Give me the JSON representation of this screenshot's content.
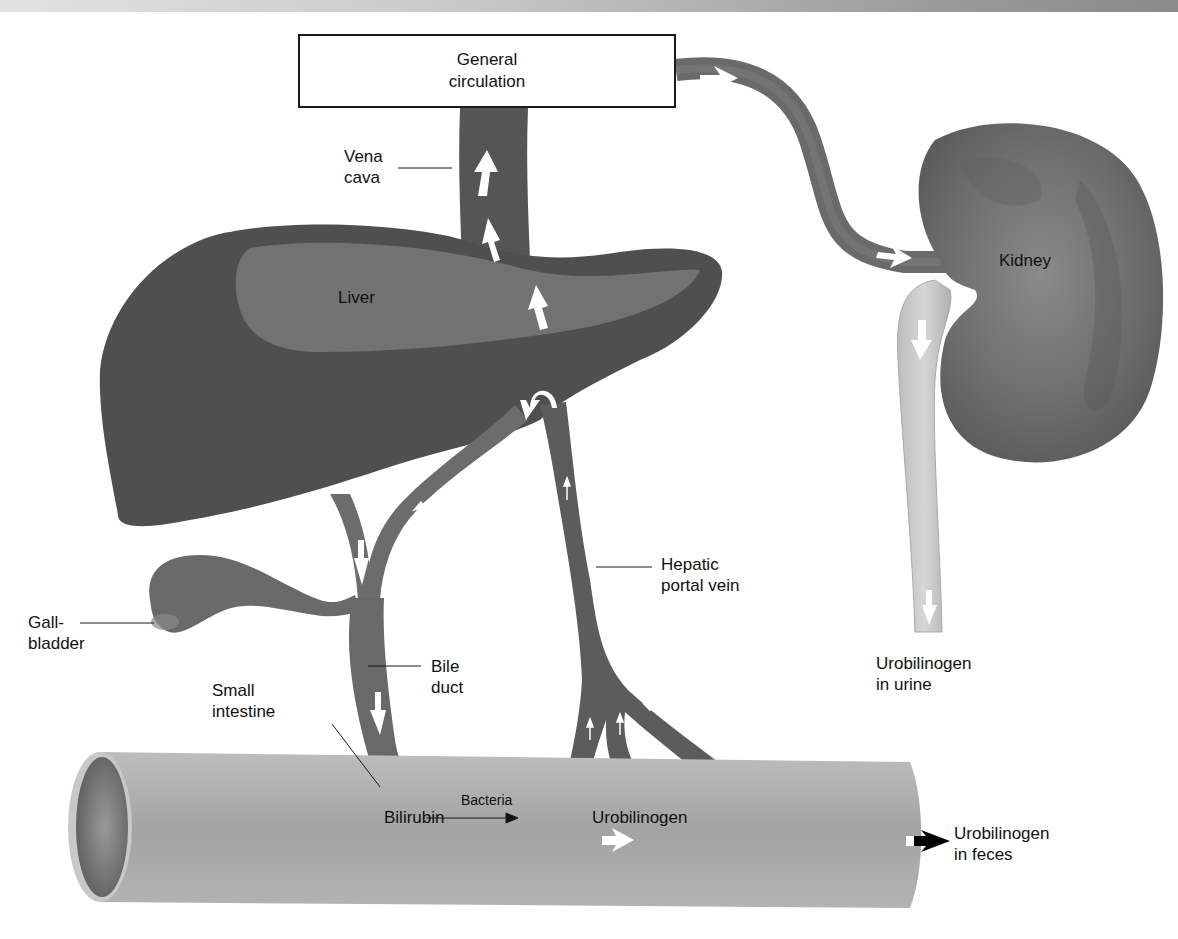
{
  "diagram": {
    "box": {
      "line1": "General",
      "line2": "circulation"
    },
    "labels": {
      "vena_cava": {
        "line1": "Vena",
        "line2": "cava"
      },
      "liver": "Liver",
      "kidney": "Kidney",
      "hepatic_portal_vein": {
        "line1": "Hepatic",
        "line2": "portal vein"
      },
      "gallbladder": {
        "line1": "Gall-",
        "line2": "bladder"
      },
      "bile_duct": {
        "line1": "Bile",
        "line2": "duct"
      },
      "small_intestine": {
        "line1": "Small",
        "line2": "intestine"
      },
      "reaction_substrate": "Bilirubin",
      "reaction_catalyst": "Bacteria",
      "reaction_product": "Urobilinogen",
      "urine_output": {
        "line1": "Urobilinogen",
        "line2": "in urine"
      },
      "feces_output": {
        "line1": "Urobilinogen",
        "line2": "in feces"
      }
    },
    "flow": [
      {
        "from": "Small intestine",
        "to": "Hepatic portal vein"
      },
      {
        "from": "Hepatic portal vein",
        "to": "Liver"
      },
      {
        "from": "Liver",
        "to": "Bile duct"
      },
      {
        "from": "Liver",
        "to": "Vena cava"
      },
      {
        "from": "Vena cava",
        "to": "General circulation"
      },
      {
        "from": "General circulation",
        "to": "Kidney"
      },
      {
        "from": "Kidney",
        "to": "Urobilinogen in urine"
      },
      {
        "from": "Gallbladder",
        "to": "Bile duct"
      },
      {
        "from": "Bile duct",
        "to": "Small intestine"
      },
      {
        "from": "Small intestine",
        "to": "Urobilinogen in feces"
      }
    ],
    "colors": {
      "organ_dark": "#4d4d4d",
      "organ_mid": "#6e6e6e",
      "liver_highlight": "#7d7d7d",
      "kidney": "#6a6a6a",
      "intestine": "#a8a8a8",
      "ureter": "#c4c4c4",
      "arrow": "#ffffff",
      "text": "#111111"
    }
  }
}
